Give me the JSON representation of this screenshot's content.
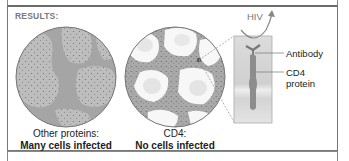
{
  "panel": {
    "header": "RESULTS:"
  },
  "left_circle": {
    "caption_line1": "Other proteins:",
    "caption_line2": "Many cells infected"
  },
  "right_circle": {
    "caption_line1": "CD4:",
    "caption_line2": "No cells infected"
  },
  "inset": {
    "virus_label": "HIV",
    "labels": [
      "Antibody",
      "CD4",
      "protein"
    ]
  },
  "colors": {
    "circle_fill": "#cfcfcf",
    "infected_fill": "#b9b9b9",
    "stroke": "#7a7a7a",
    "inset_fill": "#d8d8d8"
  }
}
